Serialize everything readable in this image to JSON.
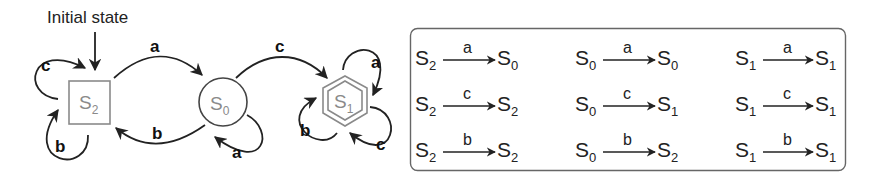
{
  "diagram": {
    "initial_label": "Initial state",
    "states": [
      {
        "id": "S2",
        "base": "S",
        "sub": "2",
        "shape": "square",
        "initial": true
      },
      {
        "id": "S0",
        "base": "S",
        "sub": "0",
        "shape": "circle"
      },
      {
        "id": "S1",
        "base": "S",
        "sub": "1",
        "shape": "double-hexagon",
        "accepting": true
      }
    ],
    "edges": [
      {
        "from": "S2",
        "to": "S2",
        "symbol": "c"
      },
      {
        "from": "S2",
        "to": "S2",
        "symbol": "b"
      },
      {
        "from": "S2",
        "to": "S0",
        "symbol": "a"
      },
      {
        "from": "S0",
        "to": "S2",
        "symbol": "b"
      },
      {
        "from": "S0",
        "to": "S0",
        "symbol": "a"
      },
      {
        "from": "S0",
        "to": "S1",
        "symbol": "c"
      },
      {
        "from": "S1",
        "to": "S1",
        "symbol": "a"
      },
      {
        "from": "S1",
        "to": "S1",
        "symbol": "b"
      },
      {
        "from": "S1",
        "to": "S1",
        "symbol": "c"
      }
    ]
  },
  "table": {
    "rows": [
      [
        {
          "from_base": "S",
          "from_sub": "2",
          "symbol": "a",
          "to_base": "S",
          "to_sub": "0"
        },
        {
          "from_base": "S",
          "from_sub": "0",
          "symbol": "a",
          "to_base": "S",
          "to_sub": "0"
        },
        {
          "from_base": "S",
          "from_sub": "1",
          "symbol": "a",
          "to_base": "S",
          "to_sub": "1"
        }
      ],
      [
        {
          "from_base": "S",
          "from_sub": "2",
          "symbol": "c",
          "to_base": "S",
          "to_sub": "2"
        },
        {
          "from_base": "S",
          "from_sub": "0",
          "symbol": "c",
          "to_base": "S",
          "to_sub": "1"
        },
        {
          "from_base": "S",
          "from_sub": "1",
          "symbol": "c",
          "to_base": "S",
          "to_sub": "1"
        }
      ],
      [
        {
          "from_base": "S",
          "from_sub": "2",
          "symbol": "b",
          "to_base": "S",
          "to_sub": "2"
        },
        {
          "from_base": "S",
          "from_sub": "0",
          "symbol": "b",
          "to_base": "S",
          "to_sub": "2"
        },
        {
          "from_base": "S",
          "from_sub": "1",
          "symbol": "b",
          "to_base": "S",
          "to_sub": "1"
        }
      ]
    ]
  },
  "colors": {
    "stroke": "#222222",
    "state_gray": "#8a8a8a",
    "box_border": "#666666"
  }
}
